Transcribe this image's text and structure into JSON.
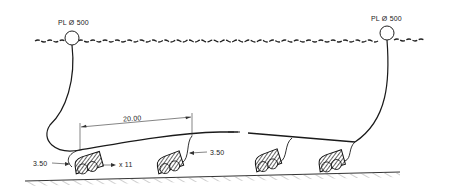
{
  "diagram": {
    "type": "longline-pot-rig",
    "buoys": [
      {
        "label": "PL Ø 500",
        "x": 72,
        "y": 38
      },
      {
        "label": "PL Ø 500",
        "x": 387,
        "y": 33
      }
    ],
    "dimensions": {
      "spacing": "20.00",
      "dropper_length_left": "3.50",
      "dropper_length_mid": "3.50",
      "pot_count": "x 11"
    },
    "pots": [
      {
        "x": 95,
        "y": 162
      },
      {
        "x": 166,
        "y": 160
      },
      {
        "x": 269,
        "y": 159
      },
      {
        "x": 334,
        "y": 158
      }
    ],
    "colors": {
      "line": "#1a1a1a",
      "background": "#ffffff"
    }
  }
}
